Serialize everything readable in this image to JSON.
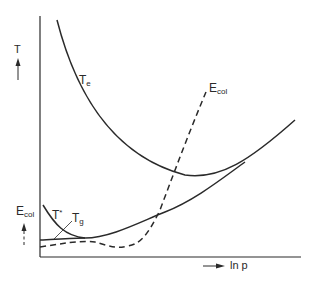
{
  "diagram": {
    "type": "schematic plot",
    "axes": {
      "y_label": "T",
      "y_label_secondary": "E",
      "y_label_secondary_sub": "col",
      "x_label": "ln p"
    },
    "curves": [
      {
        "id": "Te",
        "label": "T",
        "label_sub": "e",
        "style": "solid"
      },
      {
        "id": "Ecol",
        "label": "E",
        "label_sub": "col",
        "style": "dashed"
      },
      {
        "id": "Tstar",
        "label": "T",
        "label_sup": "*",
        "style": "solid"
      },
      {
        "id": "Tg",
        "label": "T",
        "label_sub": "g",
        "style": "solid"
      }
    ],
    "colors": {
      "ink": "#2a2a2a",
      "background": "#ffffff"
    }
  }
}
